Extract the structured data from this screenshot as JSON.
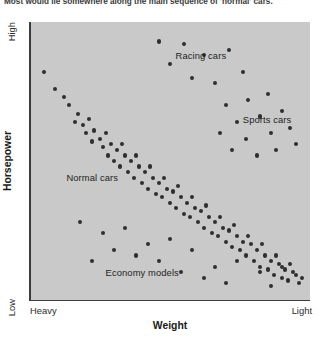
{
  "caption": "Most would lie somewhere along the main sequence of 'normal' cars.",
  "axes": {
    "y_title": "Horsepower",
    "y_high_label": "High",
    "y_low_label": "Low",
    "x_title": "Weight",
    "x_left_label": "Heavy",
    "x_right_label": "Light"
  },
  "colors": {
    "panel_background": "#c9c9c9",
    "point": "#2f2f2f",
    "axis_line": "#3c3c3c",
    "text": "#1f1f1f",
    "page_background": "#ffffff"
  },
  "annotations": [
    {
      "label": "Racing cars",
      "x": 52,
      "y": 10
    },
    {
      "label": "Sports cars",
      "x": 76,
      "y": 33
    },
    {
      "label": "Normal cars",
      "x": 13,
      "y": 54
    },
    {
      "label": "Economy models",
      "x": 27,
      "y": 88
    }
  ],
  "chart_data": {
    "type": "scatter",
    "title": "Most would lie somewhere along the main sequence of 'normal' cars.",
    "xlabel": "Weight",
    "ylabel": "Horsepower",
    "xlim": [
      0,
      100
    ],
    "ylim": [
      0,
      100
    ],
    "x_axis_direction": "Heavy (left) to Light (right)",
    "y_axis_direction": "Low (bottom) to High (top)",
    "x_tick_labels": [
      "Heavy",
      "Light"
    ],
    "y_tick_labels": [
      "Low",
      "High"
    ],
    "grid": false,
    "legend": "none",
    "annotations": [
      "Racing cars",
      "Sports cars",
      "Normal cars",
      "Economy models"
    ],
    "point_count": 126,
    "groups": [
      {
        "name": "Normal cars",
        "description": "Dense main-sequence band descending from upper-left (heavy, high horsepower) to lower-right (light, low horsepower).",
        "points": [
          [
            5,
            82
          ],
          [
            9,
            76
          ],
          [
            12,
            73
          ],
          [
            14,
            70
          ],
          [
            17,
            67
          ],
          [
            16,
            64
          ],
          [
            19,
            63
          ],
          [
            21,
            65
          ],
          [
            20,
            60
          ],
          [
            23,
            61
          ],
          [
            22,
            57
          ],
          [
            25,
            58
          ],
          [
            27,
            60
          ],
          [
            26,
            55
          ],
          [
            29,
            56
          ],
          [
            28,
            52
          ],
          [
            31,
            54
          ],
          [
            33,
            56
          ],
          [
            30,
            50
          ],
          [
            34,
            52
          ],
          [
            32,
            48
          ],
          [
            36,
            50
          ],
          [
            38,
            52
          ],
          [
            35,
            46
          ],
          [
            39,
            48
          ],
          [
            37,
            44
          ],
          [
            41,
            46
          ],
          [
            43,
            48
          ],
          [
            40,
            42
          ],
          [
            44,
            44
          ],
          [
            42,
            40
          ],
          [
            46,
            42
          ],
          [
            48,
            44
          ],
          [
            45,
            38
          ],
          [
            49,
            40
          ],
          [
            47,
            37
          ],
          [
            51,
            39
          ],
          [
            53,
            41
          ],
          [
            50,
            35
          ],
          [
            54,
            37
          ],
          [
            52,
            33
          ],
          [
            56,
            35
          ],
          [
            58,
            37
          ],
          [
            55,
            31
          ],
          [
            59,
            33
          ],
          [
            57,
            30
          ],
          [
            61,
            32
          ],
          [
            63,
            34
          ],
          [
            60,
            28
          ],
          [
            64,
            30
          ],
          [
            62,
            26
          ],
          [
            66,
            28
          ],
          [
            68,
            30
          ],
          [
            65,
            24
          ],
          [
            69,
            26
          ],
          [
            67,
            23
          ],
          [
            71,
            25
          ],
          [
            73,
            27
          ],
          [
            70,
            21
          ],
          [
            74,
            23
          ],
          [
            72,
            19
          ],
          [
            76,
            21
          ],
          [
            78,
            23
          ],
          [
            75,
            18
          ],
          [
            79,
            20
          ],
          [
            77,
            16
          ],
          [
            81,
            18
          ],
          [
            83,
            20
          ],
          [
            80,
            14
          ],
          [
            84,
            16
          ],
          [
            82,
            12
          ],
          [
            86,
            14
          ],
          [
            88,
            16
          ],
          [
            85,
            11
          ],
          [
            89,
            13
          ],
          [
            87,
            9
          ],
          [
            91,
            11
          ],
          [
            93,
            13
          ],
          [
            90,
            8
          ],
          [
            94,
            10
          ],
          [
            92,
            7
          ],
          [
            95,
            9
          ],
          [
            96,
            6
          ],
          [
            97,
            8
          ]
        ]
      },
      {
        "name": "Racing cars",
        "description": "Sparse high-horsepower outliers near the top of the plot.",
        "points": [
          [
            46,
            93
          ],
          [
            55,
            92
          ],
          [
            62,
            88
          ],
          [
            71,
            90
          ],
          [
            58,
            80
          ],
          [
            66,
            78
          ],
          [
            76,
            82
          ],
          [
            50,
            85
          ]
        ]
      },
      {
        "name": "Sports cars",
        "description": "Scattered points above the main sequence on the lighter, higher-power side.",
        "points": [
          [
            70,
            70
          ],
          [
            78,
            72
          ],
          [
            85,
            74
          ],
          [
            74,
            64
          ],
          [
            82,
            66
          ],
          [
            90,
            68
          ],
          [
            68,
            60
          ],
          [
            77,
            58
          ],
          [
            86,
            60
          ],
          [
            93,
            62
          ],
          [
            72,
            54
          ],
          [
            81,
            52
          ],
          [
            88,
            54
          ],
          [
            95,
            56
          ]
        ]
      },
      {
        "name": "Economy models",
        "description": "Sparse low-horsepower points scattered below the main sequence.",
        "points": [
          [
            18,
            28
          ],
          [
            26,
            24
          ],
          [
            34,
            26
          ],
          [
            42,
            20
          ],
          [
            50,
            22
          ],
          [
            38,
            16
          ],
          [
            46,
            14
          ],
          [
            58,
            18
          ],
          [
            66,
            12
          ],
          [
            30,
            18
          ],
          [
            54,
            10
          ],
          [
            74,
            14
          ],
          [
            62,
            8
          ],
          [
            22,
            14
          ],
          [
            82,
            10
          ],
          [
            90,
            12
          ],
          [
            70,
            6
          ],
          [
            86,
            5
          ]
        ]
      }
    ]
  }
}
